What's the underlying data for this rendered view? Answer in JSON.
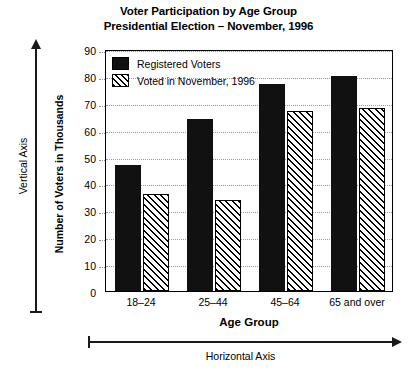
{
  "title": {
    "line1": "Voter Participation by Age Group",
    "line2": "Presidential Election – November, 1996"
  },
  "annotations": {
    "vertical_axis": "Vertical Axis",
    "horizontal_axis": "Horizontal Axis"
  },
  "chart_data": {
    "type": "bar",
    "title": "Voter Participation by Age Group Presidential Election – November, 1996",
    "xlabel": "Age Group",
    "ylabel": "Number of Voters in Thousands",
    "categories": [
      "18–24",
      "25–44",
      "45–64",
      "65 and over"
    ],
    "series": [
      {
        "name": "Registered Voters",
        "values": [
          47,
          64,
          77,
          80
        ],
        "fill": "solid-black",
        "color": "#111111"
      },
      {
        "name": "Voted in November, 1996",
        "values": [
          36,
          34,
          67,
          68
        ],
        "fill": "diagonal-hatch",
        "color": "#ffffff"
      }
    ],
    "ylim": [
      0,
      90
    ],
    "ytick_labels": [
      "90",
      "80",
      "70",
      "60",
      "50",
      "40",
      "30",
      "20",
      "10",
      "0"
    ],
    "ytick_values": [
      90,
      80,
      70,
      60,
      50,
      40,
      30,
      20,
      10,
      0
    ],
    "grid": true,
    "grid_style": "dotted-horizontal",
    "legend_position": "top-left-inside"
  }
}
